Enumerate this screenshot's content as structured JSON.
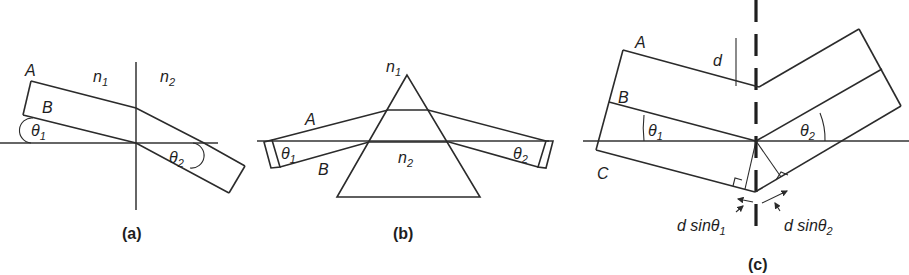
{
  "figure": {
    "panels": [
      {
        "id": "a",
        "caption": "(a)",
        "labels": {
          "ray_a": "A",
          "ray_b": "B",
          "medium_1": "n",
          "medium_1_sub": "1",
          "medium_2": "n",
          "medium_2_sub": "2",
          "angle_1": "θ",
          "angle_1_sub": "1",
          "angle_2": "θ",
          "angle_2_sub": "2"
        }
      },
      {
        "id": "b",
        "caption": "(b)",
        "labels": {
          "ray_a": "A",
          "ray_b": "B",
          "medium_1": "n",
          "medium_1_sub": "1",
          "medium_2": "n",
          "medium_2_sub": "2",
          "angle_1": "θ",
          "angle_1_sub": "1",
          "angle_2": "θ",
          "angle_2_sub": "2"
        }
      },
      {
        "id": "c",
        "caption": "(c)",
        "labels": {
          "ray_a": "A",
          "ray_b": "B",
          "ray_c": "C",
          "spacing": "d",
          "angle_1": "θ",
          "angle_1_sub": "1",
          "angle_2": "θ",
          "angle_2_sub": "2",
          "path_diff_1": "d sinθ",
          "path_diff_1_sub": "1",
          "path_diff_2": "d sinθ",
          "path_diff_2_sub": "2"
        }
      }
    ]
  }
}
